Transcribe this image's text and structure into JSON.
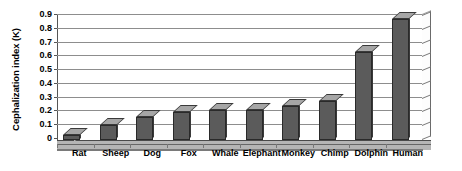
{
  "chart_data": {
    "type": "bar",
    "title": "",
    "xlabel": "",
    "ylabel": "Cephalization index (K)",
    "categories": [
      "Rat",
      "Sheep",
      "Dog",
      "Fox",
      "Whale",
      "Elephant",
      "Monkey",
      "Chimp",
      "Dolphin",
      "Human"
    ],
    "values": [
      0.04,
      0.11,
      0.17,
      0.2,
      0.22,
      0.22,
      0.25,
      0.28,
      0.64,
      0.88
    ],
    "ylim": [
      0,
      0.9
    ],
    "ytick_labels": [
      "0",
      "0.1",
      "0.2",
      "0.3",
      "0.4",
      "0.5",
      "0.6",
      "0.7",
      "0.8",
      "0.9"
    ],
    "ytick_values": [
      0,
      0.1,
      0.2,
      0.3,
      0.4,
      0.5,
      0.6,
      0.7,
      0.8,
      0.9
    ],
    "grid": true,
    "legend": false,
    "style": "3d-column",
    "series": [
      {
        "name": "Cephalization index (K)",
        "values": [
          0.04,
          0.11,
          0.17,
          0.2,
          0.22,
          0.22,
          0.25,
          0.28,
          0.64,
          0.88
        ]
      }
    ],
    "colors": {
      "bar_face": "#5b5b5b",
      "bar_side": "#cfcfcf",
      "bar_top": "#a6a6a6",
      "gridline": "#8d8d8d",
      "floor": "#b5b5b5",
      "background": "#ffffff",
      "text": "#000000"
    }
  }
}
